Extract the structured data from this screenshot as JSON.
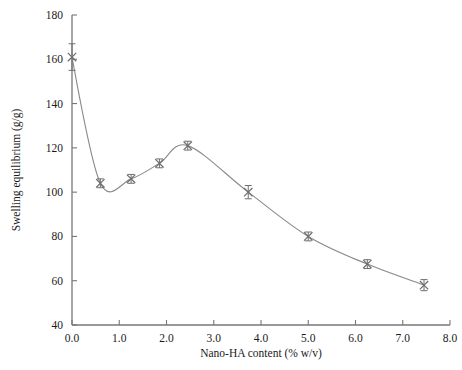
{
  "chart_data": {
    "type": "line",
    "title": "",
    "subtitle": "",
    "xlabel": "Nano-HA content  (% w/v)",
    "ylabel": "Swelling equilibrium (g/g)",
    "xlim": [
      0.0,
      8.0
    ],
    "ylim": [
      40,
      180
    ],
    "xticks": [
      0.0,
      1.0,
      2.0,
      3.0,
      4.0,
      5.0,
      6.0,
      7.0,
      8.0
    ],
    "xtick_labels": [
      "0.0",
      "1.0",
      "2.0",
      "3.0",
      "4.0",
      "5.0",
      "6.0",
      "7.0",
      "8.0"
    ],
    "yticks": [
      40,
      60,
      80,
      100,
      120,
      140,
      160,
      180
    ],
    "ytick_labels": [
      "40",
      "60",
      "80",
      "100",
      "120",
      "140",
      "160",
      "180"
    ],
    "grid": false,
    "legend": null,
    "marker": "x",
    "line_color": "#8a8a8a",
    "marker_color": "#6f6f6f",
    "axis_color": "#777777",
    "error_bars": true,
    "x": [
      0.0,
      0.6,
      1.25,
      1.85,
      2.45,
      3.73,
      5.0,
      6.25,
      7.45
    ],
    "y": [
      161,
      104,
      106,
      113,
      121,
      100,
      80,
      67.5,
      58
    ],
    "yerr": [
      6,
      2,
      2,
      2,
      2,
      3,
      2,
      2,
      2.5
    ],
    "points": [
      {
        "x": 0.0,
        "y": 161,
        "yerr": 6
      },
      {
        "x": 0.6,
        "y": 104,
        "yerr": 2
      },
      {
        "x": 1.25,
        "y": 106,
        "yerr": 2
      },
      {
        "x": 1.85,
        "y": 113,
        "yerr": 2
      },
      {
        "x": 2.45,
        "y": 121,
        "yerr": 2
      },
      {
        "x": 3.73,
        "y": 100,
        "yerr": 3
      },
      {
        "x": 5.0,
        "y": 80,
        "yerr": 2
      },
      {
        "x": 6.25,
        "y": 67.5,
        "yerr": 2
      },
      {
        "x": 7.45,
        "y": 58,
        "yerr": 2.5
      }
    ]
  }
}
